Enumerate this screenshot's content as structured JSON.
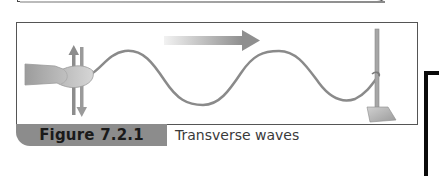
{
  "figure": {
    "label": "Figure 7.2.1",
    "title": "Transverse waves",
    "illustration": {
      "description": "Hand shaking a rope up and down; wave travels to the right toward a rope tied to a retort stand",
      "icons": [
        "hand-icon",
        "up-down-arrow-icon",
        "direction-arrow-icon",
        "retort-stand-icon"
      ],
      "colors": {
        "rope": "#8a8a8a",
        "arrow": "#9a9a9a",
        "frame": "#555555",
        "label_bg": "#8c8c8c"
      }
    }
  }
}
